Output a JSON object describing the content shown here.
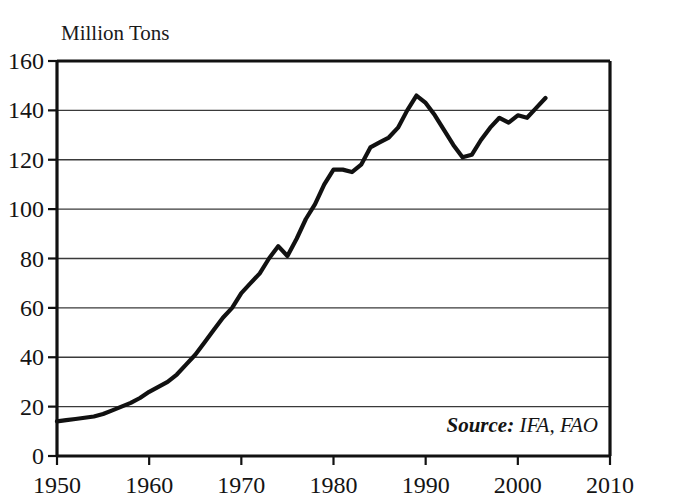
{
  "chart_data": {
    "type": "line",
    "title": "",
    "ylabel": "Million Tons",
    "xlabel": "",
    "ylim": [
      0,
      160
    ],
    "xlim": [
      1950,
      2010
    ],
    "grid": true,
    "legend": "none",
    "y_ticks": [
      0,
      20,
      40,
      60,
      80,
      100,
      120,
      140,
      160
    ],
    "y_tick_labels": [
      "0",
      "20",
      "40",
      "60",
      "80",
      "100",
      "120",
      "140",
      "160"
    ],
    "x_ticks": [
      1950,
      1960,
      1970,
      1980,
      1990,
      2000,
      2010
    ],
    "x_tick_labels": [
      "1950",
      "1960",
      "1970",
      "1980",
      "1990",
      "2000",
      "2010"
    ],
    "annotation": "Source: IFA, FAO",
    "annotation_lead": "Source:",
    "annotation_rest": " IFA, FAO",
    "series_name": "World Fertilizer Use",
    "x": [
      1950,
      1951,
      1952,
      1953,
      1954,
      1955,
      1956,
      1957,
      1958,
      1959,
      1960,
      1961,
      1962,
      1963,
      1964,
      1965,
      1966,
      1967,
      1968,
      1969,
      1970,
      1971,
      1972,
      1973,
      1974,
      1975,
      1976,
      1977,
      1978,
      1979,
      1980,
      1981,
      1982,
      1983,
      1984,
      1985,
      1986,
      1987,
      1988,
      1989,
      1990,
      1991,
      1992,
      1993,
      1994,
      1995,
      1996,
      1997,
      1998,
      1999,
      2000,
      2001,
      2002,
      2003
    ],
    "values": [
      14,
      14.5,
      15,
      15.5,
      16,
      17,
      18.5,
      20,
      21.5,
      23.5,
      26,
      28,
      30,
      33,
      37,
      41,
      46,
      51,
      56,
      60,
      66,
      70,
      74,
      80,
      85,
      81,
      88,
      96,
      102,
      110,
      116,
      116,
      115,
      118,
      125,
      127,
      129,
      133,
      140,
      146,
      143,
      138,
      132,
      126,
      121,
      122,
      128,
      133,
      137,
      135,
      138,
      137,
      141,
      145
    ]
  },
  "figure": {
    "background_color": "#ffffff",
    "line_color": "#111111",
    "grid_color": "#3a3a3a",
    "text_color": "#141414"
  }
}
